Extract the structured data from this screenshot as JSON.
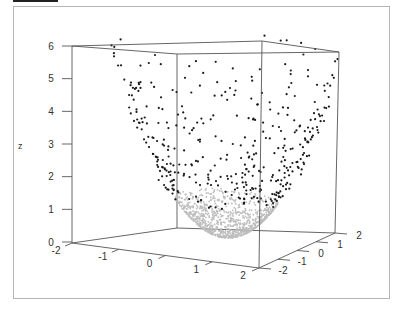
{
  "chart_data": {
    "type": "scatter",
    "subtype": "3d-scatter",
    "title": "",
    "xlabel": "",
    "ylabel": "",
    "zlabel": "z",
    "x_ticks": [
      "-2",
      "-1",
      "0",
      "1",
      "2"
    ],
    "y_ticks": [
      "-2",
      "-1",
      "0",
      "1",
      "2"
    ],
    "z_ticks": [
      "0",
      "1",
      "2",
      "3",
      "4",
      "5",
      "6"
    ],
    "xlim": [
      -2,
      2
    ],
    "ylim": [
      -2,
      2
    ],
    "zlim": [
      0,
      6
    ],
    "surface": "z = x^2 + y^2 (paraboloid)",
    "series": [
      {
        "name": "upper points",
        "color": "#1a1a1a",
        "z_range": [
          1.2,
          5.9
        ],
        "count": 420
      },
      {
        "name": "lower bowl points",
        "color": "#bdbdbd",
        "z_range": [
          0,
          1.2
        ],
        "count": 900
      }
    ],
    "grid": false,
    "legend": "none"
  },
  "colors": {
    "axis": "#555555",
    "frame": "#b5b5b5",
    "dark_points": "#1a1a1a",
    "light_points": "#bdbdbd"
  }
}
